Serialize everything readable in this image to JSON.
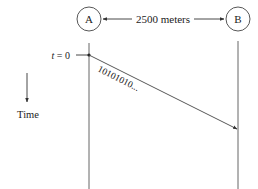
{
  "diagram": {
    "node_a": {
      "label": "A"
    },
    "node_b": {
      "label": "B"
    },
    "distance_label": "2500 meters",
    "time_zero_label": "t = 0",
    "time_zero_t": "t",
    "time_zero_rest": " = 0",
    "bit_stream_label": "10101010...",
    "time_axis_label": "Time",
    "colors": {
      "stroke": "#333333",
      "text": "#222222",
      "background": "#ffffff"
    }
  }
}
